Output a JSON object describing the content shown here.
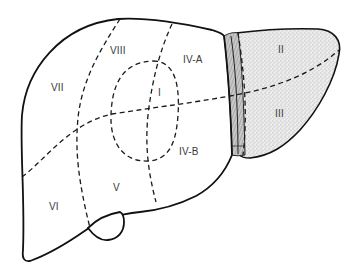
{
  "diagram": {
    "colors": {
      "outline": "#111111",
      "dashed_line": "#1a1a1a",
      "stipple_fill": "#d9d9d9",
      "ligament_fill": "#b8b8b8",
      "label": "#3a3a3a",
      "background": "#ffffff"
    },
    "segments": [
      {
        "id": "I",
        "label": "I",
        "x": 160,
        "y": 96
      },
      {
        "id": "II",
        "label": "II",
        "x": 278,
        "y": 52
      },
      {
        "id": "III",
        "label": "III",
        "x": 276,
        "y": 116
      },
      {
        "id": "IV-A",
        "label": "IV-A",
        "x": 178,
        "y": 62
      },
      {
        "id": "IV-B",
        "label": "IV-B",
        "x": 179,
        "y": 155
      },
      {
        "id": "V",
        "label": "V",
        "x": 113,
        "y": 190
      },
      {
        "id": "VI",
        "label": "VI",
        "x": 49,
        "y": 210
      },
      {
        "id": "VII",
        "label": "VII",
        "x": 51,
        "y": 91
      },
      {
        "id": "VIII",
        "label": "VIII",
        "x": 110,
        "y": 54
      }
    ],
    "structures": [
      {
        "name": "right-lobe",
        "fill": "none"
      },
      {
        "name": "left-lobe",
        "fill": "stippled"
      },
      {
        "name": "falciform-ligament",
        "fill": "hatched"
      },
      {
        "name": "gallbladder",
        "fill": "none"
      }
    ]
  }
}
